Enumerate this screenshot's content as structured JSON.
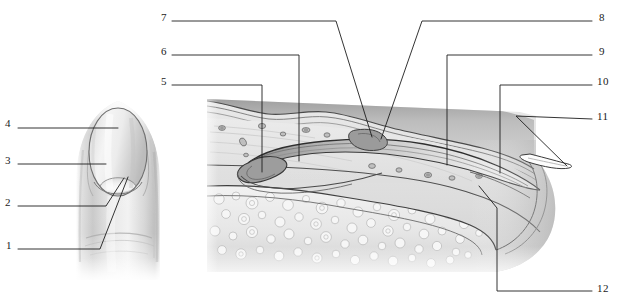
{
  "figure": {
    "background_color": "#ffffff",
    "line_color": "#1d1d1d",
    "width": 618,
    "height": 305
  },
  "panels": [
    {
      "name": "finger-dorsal-view",
      "description": "Dorsal surface view of a fingertip showing the nail plate, lunula and nail fold"
    },
    {
      "name": "finger-sagittal-section",
      "description": "Sagittal section through the distal phalanx showing nail root, nail plate, nail bed, epidermis, dermis and bone"
    }
  ],
  "labels": [
    {
      "id": "label-1",
      "text": "1",
      "side": "left",
      "x": 8,
      "y": 245
    },
    {
      "id": "label-2",
      "text": "2",
      "side": "left",
      "x": 8,
      "y": 202
    },
    {
      "id": "label-3",
      "text": "3",
      "side": "left",
      "x": 8,
      "y": 160
    },
    {
      "id": "label-4",
      "text": "4",
      "side": "left",
      "x": 8,
      "y": 124
    },
    {
      "id": "label-5",
      "text": "5",
      "side": "left",
      "x": 161,
      "y": 81
    },
    {
      "id": "label-6",
      "text": "6",
      "side": "left",
      "x": 161,
      "y": 51
    },
    {
      "id": "label-7",
      "text": "7",
      "side": "left",
      "x": 161,
      "y": 17
    },
    {
      "id": "label-8",
      "text": "8",
      "side": "right",
      "x": 600,
      "y": 17
    },
    {
      "id": "label-9",
      "text": "9",
      "side": "right",
      "x": 600,
      "y": 51
    },
    {
      "id": "label-10",
      "text": "10",
      "side": "right",
      "x": 598,
      "y": 81
    },
    {
      "id": "label-11",
      "text": "11",
      "side": "right",
      "x": 598,
      "y": 117
    },
    {
      "id": "label-12",
      "text": "12",
      "side": "right",
      "x": 598,
      "y": 290
    }
  ]
}
